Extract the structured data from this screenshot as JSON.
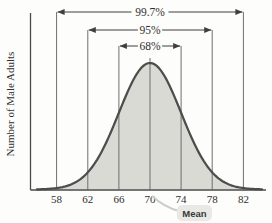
{
  "chart_data": {
    "type": "area",
    "subtype": "normal-distribution-empirical-rule",
    "title": "",
    "xlabel": "",
    "ylabel": "Number of Male Adults",
    "x_ticks": [
      58,
      62,
      66,
      70,
      74,
      78,
      82
    ],
    "mean": 70,
    "std_dev": 4,
    "mean_callout_label": "Mean",
    "intervals": [
      {
        "label": "99.7%",
        "from": 58,
        "to": 82
      },
      {
        "label": "95%",
        "from": 62,
        "to": 78
      },
      {
        "label": "68%",
        "from": 66,
        "to": 74
      }
    ],
    "legend": [],
    "grid": "vertical-boundary-lines",
    "colors": {
      "background": "#fdfdfb",
      "curve_stroke": "#4d4d4d",
      "curve_fill": "#d9dad4",
      "grid_line": "#6e6e6e",
      "axis": "#4a4a4a",
      "arrow": "#3f3f3f",
      "text": "#2f2f2f",
      "callout_box_fill": "#e8e8e4",
      "callout_text": "#3a3a3a",
      "callout_leader": "#cdcdc7"
    }
  }
}
